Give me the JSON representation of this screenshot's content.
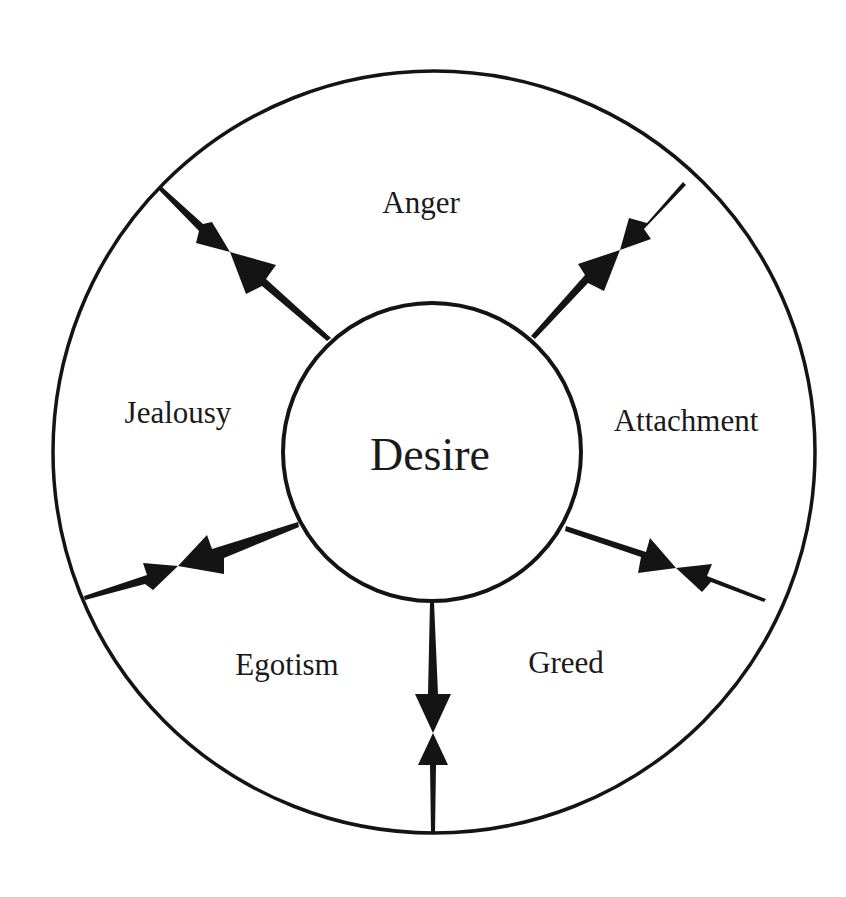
{
  "diagram": {
    "type": "concentric-circle-diagram",
    "center": {
      "label": "Desire"
    },
    "segments": [
      {
        "id": "anger",
        "label": "Anger"
      },
      {
        "id": "attachment",
        "label": "Attachment"
      },
      {
        "id": "greed",
        "label": "Greed"
      },
      {
        "id": "egotism",
        "label": "Egotism"
      },
      {
        "id": "jealousy",
        "label": "Jealousy"
      }
    ],
    "connectors": [
      {
        "between": [
          "jealousy",
          "anger"
        ],
        "style": "opposing-double-arrow"
      },
      {
        "between": [
          "anger",
          "attachment"
        ],
        "style": "opposing-double-arrow"
      },
      {
        "between": [
          "attachment",
          "greed"
        ],
        "style": "opposing-double-arrow"
      },
      {
        "between": [
          "greed",
          "egotism"
        ],
        "style": "opposing-double-arrow"
      },
      {
        "between": [
          "egotism",
          "jealousy"
        ],
        "style": "opposing-double-arrow"
      }
    ],
    "colors": {
      "ink": "#141414",
      "background": "#ffffff"
    }
  }
}
